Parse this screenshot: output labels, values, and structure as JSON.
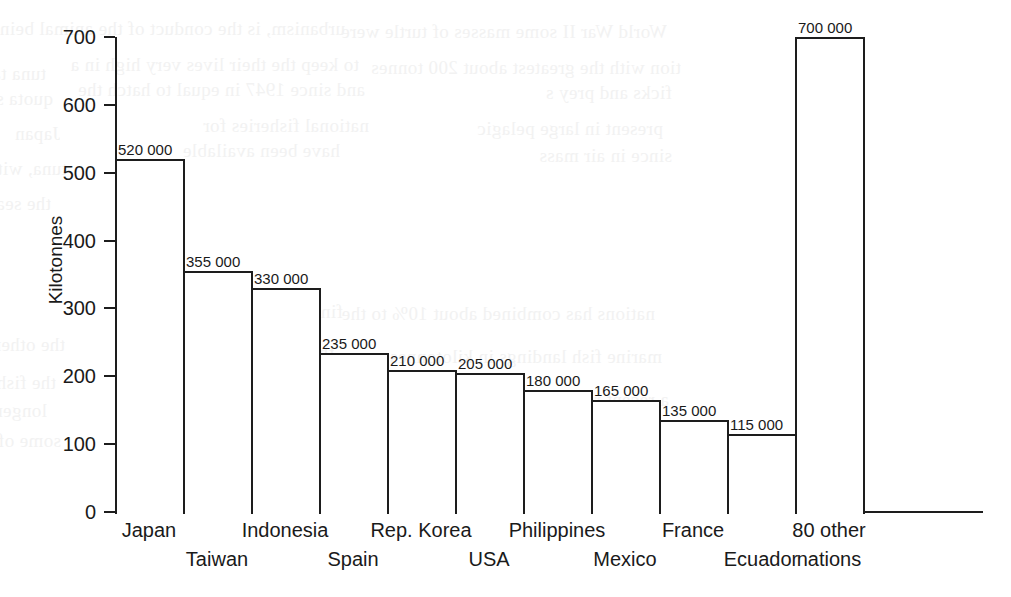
{
  "chart_data": {
    "type": "bar",
    "title": "",
    "xlabel": "",
    "ylabel": "Kilotonnes",
    "ylim": [
      0,
      700
    ],
    "yticks": [
      0,
      100,
      200,
      300,
      400,
      500,
      600,
      700
    ],
    "ytick_labels": [
      "0",
      "100",
      "200",
      "300",
      "400",
      "500",
      "600",
      "700"
    ],
    "grid": false,
    "legend": null,
    "units_note": "Bar heights are in kilotonnes; printed data labels are in tonnes.",
    "categories": [
      "Japan",
      "Taiwan",
      "Indonesia",
      "Spain",
      "Rep. Korea",
      "USA",
      "Philippines",
      "Mexico",
      "France",
      "Ecuador",
      "80 other nations"
    ],
    "category_label_lines": [
      [
        "Japan"
      ],
      [
        "Taiwan"
      ],
      [
        "Indonesia"
      ],
      [
        "Spain"
      ],
      [
        "Rep. Korea"
      ],
      [
        "USA"
      ],
      [
        "Philippines"
      ],
      [
        "Mexico"
      ],
      [
        "France"
      ],
      [
        "Ecuador"
      ],
      [
        "80 other",
        "nations"
      ]
    ],
    "values": [
      520,
      355,
      330,
      235,
      210,
      205,
      180,
      165,
      135,
      115,
      700
    ],
    "data_labels": [
      "520 000",
      "355 000",
      "330 000",
      "235 000",
      "210 000",
      "205 000",
      "180 000",
      "165 000",
      "135 000",
      "115 000",
      "700 000"
    ],
    "colors": {
      "bar_fill": "#ffffff",
      "bar_stroke": "#1d1d1d",
      "axis": "#1d1d1d",
      "text": "#1a1a1a",
      "background": "#ffffff"
    }
  },
  "bleed_through": {
    "note": "faint mirrored text showing through from the reverse side of the printed page",
    "lines": [
      "urbanism, is the conduct of the animal being",
      "World War II some masses of turtle were",
      "to keep the their lives very high in a",
      "tion with the greatest about 200 tonnes",
      "and since 1947 in equal to hatch the",
      "ficks and prey s",
      "national fisheries for",
      "present in large pelagic",
      "have been available",
      "since in air mass",
      "tuna take certain pelagic",
      "quota ship",
      "Japan",
      "tuna, with some was",
      "the sea. Of the vessels",
      "finally they will enhance",
      "the other coast by the",
      "the rest is an",
      "the fish for in so",
      "fish far and fleets was",
      "longer in resource",
      "than 1.5 million tonnes",
      "some of which have",
      "nations has combined about 10% to the",
      "marine fish landings in kilotonnes",
      "a recent report that the",
      "Over a longer time"
    ]
  }
}
